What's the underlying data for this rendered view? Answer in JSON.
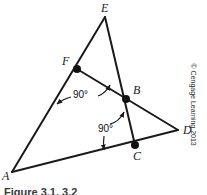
{
  "figure": {
    "type": "geometry-diagram",
    "background_color": "#ffffff",
    "stroke_color": "#1a1a1a"
  },
  "points": [
    {
      "name": "A",
      "label": "A",
      "x": 12,
      "y": 172,
      "label_x": 2,
      "label_y": 170,
      "dot": false
    },
    {
      "name": "E",
      "label": "E",
      "x": 105,
      "y": 17,
      "label_x": 101,
      "label_y": 2,
      "dot": false
    },
    {
      "name": "D",
      "label": "D",
      "x": 178,
      "y": 130,
      "label_x": 183,
      "label_y": 124,
      "dot": false
    },
    {
      "name": "F",
      "label": "F",
      "x": 77,
      "y": 69,
      "label_x": 62,
      "label_y": 55,
      "dot": true
    },
    {
      "name": "B",
      "label": "B",
      "x": 126,
      "y": 99,
      "label_x": 133,
      "label_y": 84,
      "dot": true
    },
    {
      "name": "C",
      "label": "C",
      "x": 135,
      "y": 145,
      "label_x": 133,
      "label_y": 150,
      "dot": true
    }
  ],
  "segments": [
    {
      "name": "segment-A-E",
      "from": "A",
      "to": "E"
    },
    {
      "name": "segment-A-D",
      "from": "A",
      "to": "D"
    },
    {
      "name": "segment-E-C",
      "from": "E",
      "to": "C"
    },
    {
      "name": "segment-F-D",
      "from": "F",
      "to": "D"
    }
  ],
  "angle_marks": [
    {
      "name": "right-angle-at-F",
      "value": "90°",
      "label_x": 73,
      "label_y": 90,
      "leaders": [
        {
          "name": "leader-to-AE",
          "x1": 71,
          "y1": 97,
          "x2": 57,
          "y2": 104
        },
        {
          "name": "leader-to-FB",
          "x1": 98,
          "y1": 96,
          "x2": 110,
          "y2": 85
        }
      ]
    },
    {
      "name": "right-angle-at-C",
      "value": "90°",
      "label_x": 98,
      "label_y": 124,
      "leaders": [
        {
          "name": "leader-to-FB",
          "x1": 110,
          "y1": 124,
          "x2": 124,
          "y2": 112
        },
        {
          "name": "leader-to-AD",
          "x1": 104,
          "y1": 136,
          "x2": 104,
          "y2": 150
        }
      ]
    }
  ],
  "copyright": {
    "text": "© Cengage Learning 2013"
  },
  "caption": {
    "text": "Figure 3.1, 3.2"
  }
}
